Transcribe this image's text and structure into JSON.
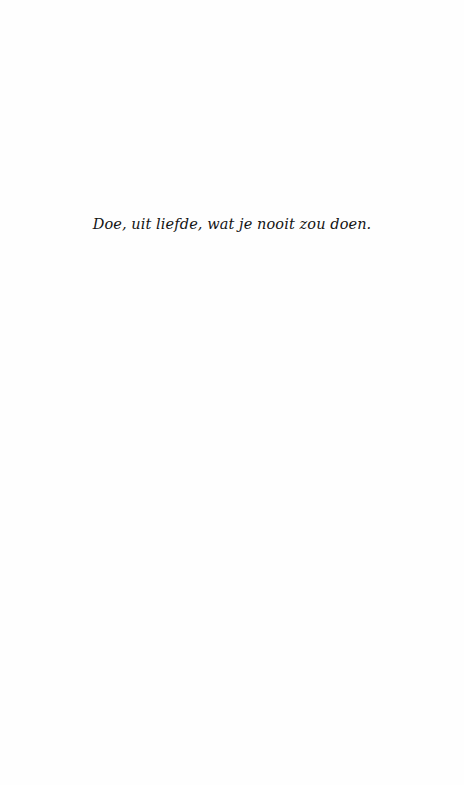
{
  "page": {
    "type": "epigraph-page",
    "background": "#fefefe"
  },
  "epigraph": {
    "text": "Doe, uit liefde, wat je nooit zou doen.",
    "color": "#141414"
  }
}
